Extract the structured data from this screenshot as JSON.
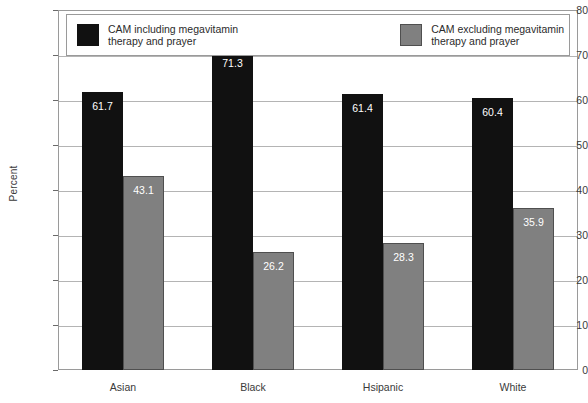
{
  "chart_data": {
    "type": "bar",
    "title": "",
    "xlabel": "",
    "ylabel": "Percent",
    "ylim": [
      0,
      80
    ],
    "ytick_step": 10,
    "yticks": [
      0,
      10,
      20,
      30,
      40,
      50,
      60,
      70,
      80
    ],
    "grid": true,
    "legend_position": "top-inside",
    "categories": [
      "Asian",
      "Black",
      "Hsipanic",
      "White"
    ],
    "series": [
      {
        "name": "CAM including megavitamin\ntherapy and prayer",
        "color": "#111111",
        "values": [
          61.7,
          71.3,
          61.4,
          60.4
        ]
      },
      {
        "name": "CAM excluding megavitamin\ntherapy and prayer",
        "color": "#808080",
        "values": [
          43.1,
          26.2,
          28.3,
          35.9
        ]
      }
    ]
  },
  "axis": {
    "y_title": "Percent",
    "y_labels": [
      "80",
      "70",
      "60",
      "50",
      "40",
      "30",
      "20",
      "10",
      "0"
    ],
    "x_labels": [
      "Asian",
      "Black",
      "Hsipanic",
      "White"
    ]
  },
  "legend": {
    "items": [
      {
        "label": "CAM including megavitamin\ntherapy and prayer",
        "swatch": "black-swatch"
      },
      {
        "label": "CAM excluding megavitamin\ntherapy and prayer",
        "swatch": "gray-swatch"
      }
    ]
  },
  "bar_labels": {
    "asian": [
      "61.7",
      "43.1"
    ],
    "black": [
      "71.3",
      "26.2"
    ],
    "hsipanic": [
      "61.4",
      "28.3"
    ],
    "white": [
      "60.4",
      "35.9"
    ]
  },
  "colors": {
    "series_0": "#111111",
    "series_1": "#808080",
    "gridline": "#b4b4b4",
    "frame": "#9a9a9a",
    "text": "#2b2b2b",
    "background": "#ffffff"
  }
}
